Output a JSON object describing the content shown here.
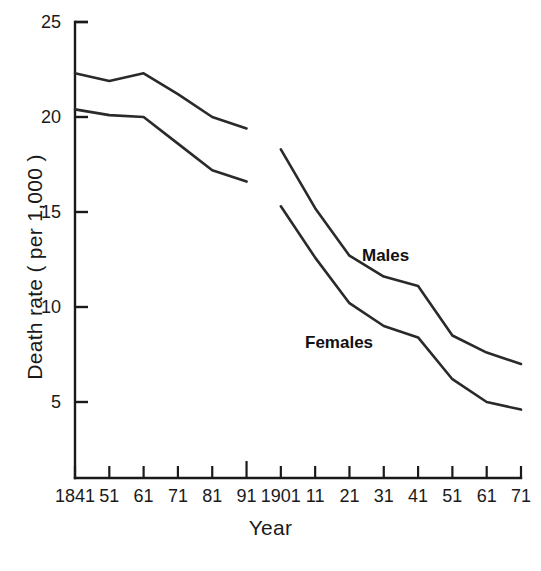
{
  "chart_data": {
    "type": "line",
    "title": "",
    "xlabel": "Year",
    "ylabel": "Death rate ( per 1,000 )",
    "ylim": [
      0,
      25
    ],
    "yticks": [
      5,
      10,
      15,
      20,
      25
    ],
    "grid": false,
    "legend_position": "inline-annotation",
    "x": [
      1841,
      1851,
      1861,
      1871,
      1881,
      1891,
      1901,
      1911,
      1921,
      1931,
      1941,
      1951,
      1961,
      1971
    ],
    "xtick_labels": [
      "1841",
      "51",
      "61",
      "71",
      "81",
      "91",
      "1901",
      "11",
      "21",
      "31",
      "41",
      "51",
      "61",
      "71"
    ],
    "series": [
      {
        "name": "Males",
        "label": "Males",
        "note": "break in record between 1891 and 1901",
        "segments": [
          {
            "x": [
              1841,
              1851,
              1861,
              1871,
              1881,
              1891
            ],
            "values": [
              22.3,
              21.9,
              22.3,
              21.2,
              20.0,
              19.4
            ]
          },
          {
            "x": [
              1901,
              1911,
              1921,
              1931,
              1941,
              1951,
              1961,
              1971
            ],
            "values": [
              18.3,
              15.2,
              12.7,
              11.6,
              11.1,
              8.5,
              7.6,
              7.0
            ]
          }
        ]
      },
      {
        "name": "Females",
        "label": "Females",
        "note": "break in record between 1891 and 1901",
        "segments": [
          {
            "x": [
              1841,
              1851,
              1861,
              1871,
              1881,
              1891
            ],
            "values": [
              20.4,
              20.1,
              20.0,
              18.6,
              17.2,
              16.6
            ]
          },
          {
            "x": [
              1901,
              1911,
              1921,
              1931,
              1941,
              1951,
              1961,
              1971
            ],
            "values": [
              15.3,
              12.6,
              10.2,
              9.0,
              8.4,
              6.2,
              5.0,
              4.6
            ]
          }
        ]
      }
    ],
    "annotations": [
      {
        "text": "Males",
        "x_px": 362,
        "y_px": 246
      },
      {
        "text": "Females",
        "x_px": 305,
        "y_px": 333
      }
    ]
  },
  "axis": {
    "y_title": "Death rate ( per 1,000 )",
    "x_title": "Year",
    "y_tick_labels": [
      "25",
      "20",
      "15",
      "10",
      "5"
    ],
    "x_tick_labels": [
      "1841",
      "51",
      "61",
      "71",
      "81",
      "91",
      "1901",
      "11",
      "21",
      "31",
      "41",
      "51",
      "61",
      "71"
    ]
  },
  "annotations": {
    "males": "Males",
    "females": "Females"
  },
  "caption": {
    "ghost_text": ""
  },
  "colors": {
    "line": "#2a2a2a",
    "axis": "#1a1a1a",
    "background": "#ffffff",
    "text": "#1a1a1a"
  }
}
